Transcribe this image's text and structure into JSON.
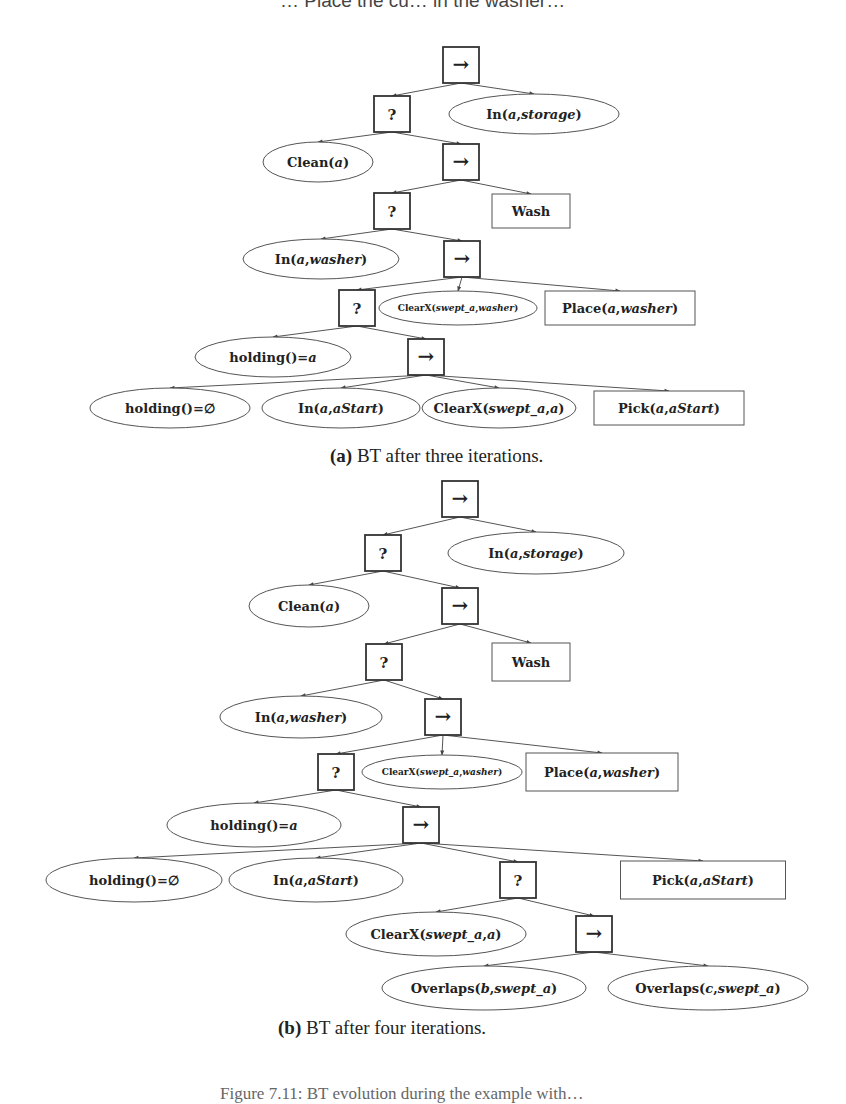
{
  "top_cutoff_text": "… Place the cu… in the washer…",
  "bottom_cutoff_text": "Figure 7.11: BT evolution during the example with…",
  "figures": [
    {
      "id": "a",
      "caption_label": "(a)",
      "caption_text": " BT after three iterations.",
      "caption_pos": [
        330,
        462
      ],
      "nodes": [
        {
          "id": "r",
          "type": "sequence",
          "symbol": "→",
          "x": 461,
          "y": 65
        },
        {
          "id": "f1",
          "type": "fallback",
          "symbol": "?",
          "x": 392,
          "y": 114
        },
        {
          "id": "c_storage",
          "type": "condition",
          "parts": [
            [
              "In(",
              0
            ],
            [
              "a",
              1
            ],
            [
              ",",
              0
            ],
            [
              "storage",
              1
            ],
            [
              ")",
              0
            ]
          ],
          "x": 534,
          "y": 114,
          "rx": 85,
          "ry": 20
        },
        {
          "id": "c_clean",
          "type": "condition",
          "parts": [
            [
              "Clean(",
              0
            ],
            [
              "a",
              1
            ],
            [
              ")",
              0
            ]
          ],
          "x": 318,
          "y": 162,
          "rx": 55,
          "ry": 20
        },
        {
          "id": "s2",
          "type": "sequence",
          "symbol": "→",
          "x": 461,
          "y": 162
        },
        {
          "id": "f2",
          "type": "fallback",
          "symbol": "?",
          "x": 392,
          "y": 211
        },
        {
          "id": "a_wash",
          "type": "action",
          "parts": [
            [
              "Wash",
              0
            ]
          ],
          "x": 531,
          "y": 211,
          "w": 78,
          "h": 34
        },
        {
          "id": "c_inwasher",
          "type": "condition",
          "parts": [
            [
              "In(",
              0
            ],
            [
              "a",
              1
            ],
            [
              ",",
              0
            ],
            [
              "washer",
              1
            ],
            [
              ")",
              0
            ]
          ],
          "x": 321,
          "y": 259,
          "rx": 78,
          "ry": 20
        },
        {
          "id": "s3",
          "type": "sequence",
          "symbol": "→",
          "x": 462,
          "y": 259
        },
        {
          "id": "f3",
          "type": "fallback",
          "symbol": "?",
          "x": 357,
          "y": 308
        },
        {
          "id": "c_clearx_w",
          "type": "condition",
          "small": true,
          "parts": [
            [
              "ClearX(",
              0
            ],
            [
              "swept_a",
              1
            ],
            [
              ",",
              0
            ],
            [
              "washer",
              1
            ],
            [
              ")",
              0
            ]
          ],
          "x": 458,
          "y": 308,
          "rx": 79,
          "ry": 17
        },
        {
          "id": "a_place",
          "type": "action",
          "parts": [
            [
              "Place(",
              0
            ],
            [
              "a",
              1
            ],
            [
              ",",
              0
            ],
            [
              "washer",
              1
            ],
            [
              ")",
              0
            ]
          ],
          "x": 620,
          "y": 308,
          "w": 150,
          "h": 34
        },
        {
          "id": "c_hold_a",
          "type": "condition",
          "parts": [
            [
              "holding()=",
              0
            ],
            [
              "a",
              1
            ]
          ],
          "x": 273,
          "y": 357,
          "rx": 78,
          "ry": 20
        },
        {
          "id": "s4",
          "type": "sequence",
          "symbol": "→",
          "x": 426,
          "y": 357
        },
        {
          "id": "c_hold_empty",
          "type": "condition",
          "parts": [
            [
              "holding()=∅",
              0
            ]
          ],
          "x": 170,
          "y": 408,
          "rx": 80,
          "ry": 20
        },
        {
          "id": "c_in_start",
          "type": "condition",
          "parts": [
            [
              "In(",
              0
            ],
            [
              "a",
              1
            ],
            [
              ",",
              0
            ],
            [
              "aStart",
              1
            ],
            [
              ")",
              0
            ]
          ],
          "x": 341,
          "y": 408,
          "rx": 79,
          "ry": 20
        },
        {
          "id": "c_clearx_a",
          "type": "condition",
          "parts": [
            [
              "ClearX(",
              0
            ],
            [
              "swept_a",
              1
            ],
            [
              ",",
              0
            ],
            [
              "a",
              1
            ],
            [
              ")",
              0
            ]
          ],
          "x": 499,
          "y": 408,
          "rx": 77,
          "ry": 20
        },
        {
          "id": "a_pick",
          "type": "action",
          "parts": [
            [
              "Pick(",
              0
            ],
            [
              "a",
              1
            ],
            [
              ",",
              0
            ],
            [
              "aStart",
              1
            ],
            [
              ")",
              0
            ]
          ],
          "x": 669,
          "y": 408,
          "w": 150,
          "h": 34
        }
      ],
      "edges": [
        [
          "r",
          "f1"
        ],
        [
          "r",
          "c_storage"
        ],
        [
          "f1",
          "c_clean"
        ],
        [
          "f1",
          "s2"
        ],
        [
          "s2",
          "f2"
        ],
        [
          "s2",
          "a_wash"
        ],
        [
          "f2",
          "c_inwasher"
        ],
        [
          "f2",
          "s3"
        ],
        [
          "s3",
          "f3"
        ],
        [
          "s3",
          "c_clearx_w"
        ],
        [
          "s3",
          "a_place"
        ],
        [
          "f3",
          "c_hold_a"
        ],
        [
          "f3",
          "s4"
        ],
        [
          "s4",
          "c_hold_empty"
        ],
        [
          "s4",
          "c_in_start"
        ],
        [
          "s4",
          "c_clearx_a"
        ],
        [
          "s4",
          "a_pick"
        ]
      ]
    },
    {
      "id": "b",
      "caption_label": "(b)",
      "caption_text": " BT after four iterations.",
      "caption_pos": [
        278,
        1034
      ],
      "nodes": [
        {
          "id": "r",
          "type": "sequence",
          "symbol": "→",
          "x": 460,
          "y": 499
        },
        {
          "id": "f1",
          "type": "fallback",
          "symbol": "?",
          "x": 383,
          "y": 553
        },
        {
          "id": "c_storage",
          "type": "condition",
          "parts": [
            [
              "In(",
              0
            ],
            [
              "a",
              1
            ],
            [
              ",",
              0
            ],
            [
              "storage",
              1
            ],
            [
              ")",
              0
            ]
          ],
          "x": 536,
          "y": 553,
          "rx": 88,
          "ry": 21
        },
        {
          "id": "c_clean",
          "type": "condition",
          "parts": [
            [
              "Clean(",
              0
            ],
            [
              "a",
              1
            ],
            [
              ")",
              0
            ]
          ],
          "x": 309,
          "y": 606,
          "rx": 60,
          "ry": 21
        },
        {
          "id": "s2",
          "type": "sequence",
          "symbol": "→",
          "x": 460,
          "y": 606
        },
        {
          "id": "f2",
          "type": "fallback",
          "symbol": "?",
          "x": 384,
          "y": 662
        },
        {
          "id": "a_wash",
          "type": "action",
          "parts": [
            [
              "Wash",
              0
            ]
          ],
          "x": 531,
          "y": 662,
          "w": 78,
          "h": 38
        },
        {
          "id": "c_inwasher",
          "type": "condition",
          "parts": [
            [
              "In(",
              0
            ],
            [
              "a",
              1
            ],
            [
              ",",
              0
            ],
            [
              "washer",
              1
            ],
            [
              ")",
              0
            ]
          ],
          "x": 301,
          "y": 717,
          "rx": 81,
          "ry": 21
        },
        {
          "id": "s3",
          "type": "sequence",
          "symbol": "→",
          "x": 443,
          "y": 717
        },
        {
          "id": "f3",
          "type": "fallback",
          "symbol": "?",
          "x": 336,
          "y": 772
        },
        {
          "id": "c_clearx_w",
          "type": "condition",
          "small": true,
          "parts": [
            [
              "ClearX(",
              0
            ],
            [
              "swept_a",
              1
            ],
            [
              ",",
              0
            ],
            [
              "washer",
              1
            ],
            [
              ")",
              0
            ]
          ],
          "x": 442,
          "y": 772,
          "rx": 80,
          "ry": 17
        },
        {
          "id": "a_place",
          "type": "action",
          "parts": [
            [
              "Place(",
              0
            ],
            [
              "a",
              1
            ],
            [
              ",",
              0
            ],
            [
              "washer",
              1
            ],
            [
              ")",
              0
            ]
          ],
          "x": 602,
          "y": 772,
          "w": 152,
          "h": 38
        },
        {
          "id": "c_hold_a",
          "type": "condition",
          "parts": [
            [
              "holding()=",
              0
            ],
            [
              "a",
              1
            ]
          ],
          "x": 254,
          "y": 825,
          "rx": 87,
          "ry": 22
        },
        {
          "id": "s4",
          "type": "sequence",
          "symbol": "→",
          "x": 421,
          "y": 825
        },
        {
          "id": "c_hold_empty",
          "type": "condition",
          "parts": [
            [
              "holding()=∅",
              0
            ]
          ],
          "x": 134,
          "y": 880,
          "rx": 88,
          "ry": 22
        },
        {
          "id": "c_in_start",
          "type": "condition",
          "parts": [
            [
              "In(",
              0
            ],
            [
              "a",
              1
            ],
            [
              ",",
              0
            ],
            [
              "aStart",
              1
            ],
            [
              ")",
              0
            ]
          ],
          "x": 316,
          "y": 880,
          "rx": 87,
          "ry": 22
        },
        {
          "id": "f4",
          "type": "fallback",
          "symbol": "?",
          "x": 518,
          "y": 880
        },
        {
          "id": "a_pick",
          "type": "action",
          "parts": [
            [
              "Pick(",
              0
            ],
            [
              "a",
              1
            ],
            [
              ",",
              0
            ],
            [
              "aStart",
              1
            ],
            [
              ")",
              0
            ]
          ],
          "x": 703,
          "y": 880,
          "w": 165,
          "h": 38
        },
        {
          "id": "c_clearx_a",
          "type": "condition",
          "parts": [
            [
              "ClearX(",
              0
            ],
            [
              "swept_a",
              1
            ],
            [
              ",",
              0
            ],
            [
              "a",
              1
            ],
            [
              ")",
              0
            ]
          ],
          "x": 436,
          "y": 934,
          "rx": 90,
          "ry": 22
        },
        {
          "id": "s5",
          "type": "sequence",
          "symbol": "→",
          "x": 594,
          "y": 934
        },
        {
          "id": "c_overlap_b",
          "type": "condition",
          "parts": [
            [
              "Overlaps(",
              0
            ],
            [
              "b",
              1
            ],
            [
              ",",
              0
            ],
            [
              "swept_a",
              1
            ],
            [
              ")",
              0
            ]
          ],
          "x": 484,
          "y": 988,
          "rx": 102,
          "ry": 22
        },
        {
          "id": "c_overlap_c",
          "type": "condition",
          "parts": [
            [
              "Overlaps(",
              0
            ],
            [
              "c",
              1
            ],
            [
              ",",
              0
            ],
            [
              "swept_a",
              1
            ],
            [
              ")",
              0
            ]
          ],
          "x": 708,
          "y": 988,
          "rx": 100,
          "ry": 22
        }
      ],
      "edges": [
        [
          "r",
          "f1"
        ],
        [
          "r",
          "c_storage"
        ],
        [
          "f1",
          "c_clean"
        ],
        [
          "f1",
          "s2"
        ],
        [
          "s2",
          "f2"
        ],
        [
          "s2",
          "a_wash"
        ],
        [
          "f2",
          "c_inwasher"
        ],
        [
          "f2",
          "s3"
        ],
        [
          "s3",
          "f3"
        ],
        [
          "s3",
          "c_clearx_w"
        ],
        [
          "s3",
          "a_place"
        ],
        [
          "f3",
          "c_hold_a"
        ],
        [
          "f3",
          "s4"
        ],
        [
          "s4",
          "c_hold_empty"
        ],
        [
          "s4",
          "c_in_start"
        ],
        [
          "s4",
          "f4"
        ],
        [
          "s4",
          "a_pick"
        ],
        [
          "f4",
          "c_clearx_a"
        ],
        [
          "f4",
          "s5"
        ],
        [
          "s5",
          "c_overlap_b"
        ],
        [
          "s5",
          "c_overlap_c"
        ]
      ]
    }
  ],
  "colors": {
    "stroke": "#333333",
    "background": "#ffffff",
    "text": "#222222"
  }
}
